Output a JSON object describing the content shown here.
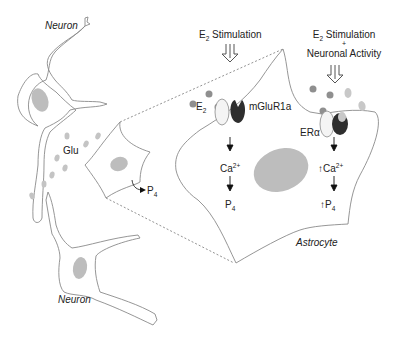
{
  "diagram": {
    "labels": {
      "neuron_top": "Neuron",
      "neuron_bottom": "Neuron",
      "glu": "Glu",
      "astrocyte": "Astrocyte",
      "small_astro_p": "P",
      "small_astro_p_sub": "4",
      "stim_left_main": "E",
      "stim_left_sub": "2",
      "stim_left_rest": " Stimulation",
      "stim_right_main": "E",
      "stim_right_sub": "2",
      "stim_right_rest": " Stimulation",
      "stim_right_plus": "+",
      "stim_right_line2": "Neuronal Activity",
      "e2_main": "E",
      "e2_sub": "2",
      "mglur": "mGluR1a",
      "era": "ERα",
      "ca_left": "Ca",
      "ca_left_sup": "2+",
      "p4_left": "P",
      "p4_left_sub": "4",
      "ca_right_prefix": "↑",
      "ca_right": "Ca",
      "ca_right_sup": "2+",
      "p4_right_prefix": "↑",
      "p4_right": "P",
      "p4_right_sub": "4"
    },
    "colors": {
      "outline": "#777777",
      "nucleus": "#bdbdbd",
      "dark_dot": "#8f8f8f",
      "light_dot": "#c8c8c8",
      "receptor_dark": "#2e2e2e",
      "arrow": "#111111"
    }
  }
}
